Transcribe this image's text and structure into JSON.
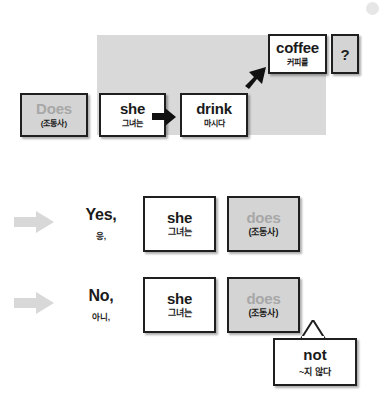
{
  "worksheet": {
    "title": "Does she drink coffee? Yes/No answers",
    "colors": {
      "panel_gray": "#d9d9d9",
      "card_gray": "#d4d4d4",
      "muted_text": "#a7a7a7",
      "ink": "#1f1f1f",
      "block_arrow": "#d8d8d8"
    }
  },
  "question_row": {
    "aux_card": {
      "en": "Does",
      "ko": "(조동사)",
      "style": "gray-muted"
    },
    "subject_card": {
      "en": "she",
      "ko": "그녀는",
      "style": "white"
    },
    "verb_card": {
      "en": "drink",
      "ko": "마시다",
      "style": "white"
    },
    "object_card": {
      "en": "coffee",
      "ko": "커피를",
      "style": "white"
    },
    "qmark_card": {
      "en": "?",
      "style": "gray"
    },
    "arrows": {
      "subject_to_verb": "arrow-right-icon",
      "verb_to_object": "arrow-up-right-icon"
    }
  },
  "answers": [
    {
      "lead_arrow": "block-arrow-right-icon",
      "word": {
        "en": "Yes,",
        "ko": "응,"
      },
      "subject_card": {
        "en": "she",
        "ko": "그녀는",
        "style": "white"
      },
      "aux_card": {
        "en": "does",
        "ko": "(조동사)",
        "style": "gray-muted"
      }
    },
    {
      "lead_arrow": "block-arrow-right-icon",
      "word": {
        "en": "No,",
        "ko": "아니,"
      },
      "subject_card": {
        "en": "she",
        "ko": "그녀는",
        "style": "white"
      },
      "aux_card": {
        "en": "does",
        "ko": "(조동사)",
        "style": "gray-muted"
      }
    }
  ],
  "callout": {
    "en": "not",
    "ko": "~지 않다"
  }
}
